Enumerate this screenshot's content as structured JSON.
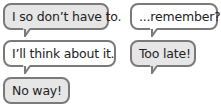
{
  "bubbles": [
    {
      "text": "I so don’t have to.",
      "fill": "#e6e6e6"
    },
    {
      "text": "...remember?",
      "fill": "#ffffff"
    },
    {
      "text": "I’ll think about it.",
      "fill": "#ffffff"
    },
    {
      "text": "Too late!",
      "fill": "#e6e6e6"
    },
    {
      "text": "No way!",
      "fill": "#e6e6e6"
    }
  ],
  "colors": {
    "border": "#7a7a7a",
    "gray_fill": "#e6e6e6",
    "white_fill": "#ffffff",
    "text": "#222222"
  }
}
